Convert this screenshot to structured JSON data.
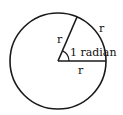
{
  "diagram": {
    "labels": {
      "radius_upper": "r",
      "arc": "r",
      "angle": "1 radian",
      "radius_lower": "r"
    },
    "colors": {
      "stroke": "#1a1a1a",
      "background": "#ffffff"
    }
  }
}
